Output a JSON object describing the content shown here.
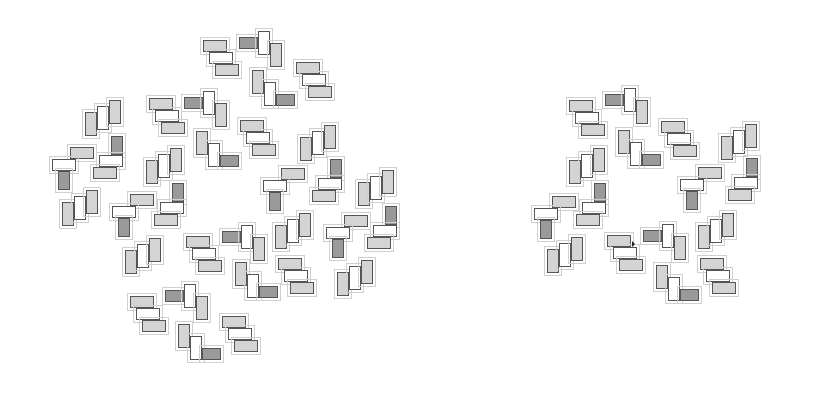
{
  "diagram": {
    "colors": {
      "light": "#d4d4d4",
      "white": "#ffffff",
      "dark": "#9a9a9a",
      "stroke": "#555555",
      "guide": "#d0d0d0"
    },
    "motif_types": {
      "H3": [
        [
          "light",
          0,
          0,
          24,
          12
        ],
        [
          "white",
          6,
          12,
          24,
          12
        ],
        [
          "light",
          12,
          24,
          24,
          12
        ]
      ],
      "V3": [
        [
          "light",
          0,
          12,
          12,
          24
        ],
        [
          "white",
          12,
          6,
          12,
          24
        ],
        [
          "light",
          24,
          0,
          12,
          24
        ]
      ],
      "Z": [
        [
          "dark",
          0,
          6,
          19,
          12
        ],
        [
          "white",
          19,
          0,
          12,
          24
        ],
        [
          "light",
          31,
          12,
          12,
          24
        ]
      ],
      "Zv": [
        [
          "light",
          0,
          0,
          12,
          24
        ],
        [
          "white",
          12,
          12,
          12,
          24
        ],
        [
          "dark",
          24,
          24,
          19,
          12
        ]
      ],
      "Tb": [
        [
          "light",
          18,
          0,
          24,
          12
        ],
        [
          "white",
          0,
          12,
          24,
          12
        ],
        [
          "dark",
          6,
          24,
          12,
          19
        ]
      ],
      "Tt": [
        [
          "dark",
          18,
          0,
          12,
          19
        ],
        [
          "white",
          6,
          19,
          24,
          12
        ],
        [
          "light",
          0,
          31,
          24,
          12
        ]
      ]
    },
    "left_panel": {
      "motifs": [
        {
          "type": "H3",
          "x": 203,
          "y": 40
        },
        {
          "type": "Z",
          "x": 239,
          "y": 31
        },
        {
          "type": "H3",
          "x": 296,
          "y": 62
        },
        {
          "type": "V3",
          "x": 85,
          "y": 100
        },
        {
          "type": "H3",
          "x": 149,
          "y": 98
        },
        {
          "type": "Z",
          "x": 184,
          "y": 91
        },
        {
          "type": "Zv",
          "x": 252,
          "y": 70
        },
        {
          "type": "H3",
          "x": 240,
          "y": 120
        },
        {
          "type": "Zv",
          "x": 196,
          "y": 131
        },
        {
          "type": "V3",
          "x": 300,
          "y": 125
        },
        {
          "type": "Tb",
          "x": 52,
          "y": 147
        },
        {
          "type": "Tt",
          "x": 93,
          "y": 136
        },
        {
          "type": "V3",
          "x": 146,
          "y": 148
        },
        {
          "type": "Tt",
          "x": 154,
          "y": 183
        },
        {
          "type": "V3",
          "x": 62,
          "y": 190
        },
        {
          "type": "Tb",
          "x": 112,
          "y": 194
        },
        {
          "type": "Tb",
          "x": 263,
          "y": 168
        },
        {
          "type": "Tt",
          "x": 312,
          "y": 159
        },
        {
          "type": "V3",
          "x": 358,
          "y": 170
        },
        {
          "type": "V3",
          "x": 275,
          "y": 213
        },
        {
          "type": "Tt",
          "x": 367,
          "y": 206
        },
        {
          "type": "Tb",
          "x": 326,
          "y": 215
        },
        {
          "type": "V3",
          "x": 125,
          "y": 238
        },
        {
          "type": "H3",
          "x": 186,
          "y": 236
        },
        {
          "type": "Z",
          "x": 222,
          "y": 225
        },
        {
          "type": "Zv",
          "x": 235,
          "y": 262
        },
        {
          "type": "H3",
          "x": 278,
          "y": 258
        },
        {
          "type": "V3",
          "x": 337,
          "y": 260
        },
        {
          "type": "H3",
          "x": 130,
          "y": 296
        },
        {
          "type": "Z",
          "x": 165,
          "y": 284
        },
        {
          "type": "Zv",
          "x": 178,
          "y": 324
        },
        {
          "type": "H3",
          "x": 222,
          "y": 316
        }
      ]
    },
    "right_panel": {
      "motifs": [
        {
          "type": "H3",
          "x": 569,
          "y": 100
        },
        {
          "type": "Z",
          "x": 605,
          "y": 88
        },
        {
          "type": "H3",
          "x": 661,
          "y": 121
        },
        {
          "type": "Zv",
          "x": 618,
          "y": 130
        },
        {
          "type": "V3",
          "x": 569,
          "y": 148
        },
        {
          "type": "V3",
          "x": 721,
          "y": 124
        },
        {
          "type": "Tb",
          "x": 534,
          "y": 196
        },
        {
          "type": "Tt",
          "x": 576,
          "y": 183
        },
        {
          "type": "Tb",
          "x": 680,
          "y": 167
        },
        {
          "type": "Tt",
          "x": 728,
          "y": 158
        },
        {
          "type": "V3",
          "x": 547,
          "y": 237
        },
        {
          "type": "H3",
          "x": 607,
          "y": 235
        },
        {
          "type": "Z",
          "x": 643,
          "y": 224
        },
        {
          "type": "V3",
          "x": 698,
          "y": 213
        },
        {
          "type": "Zv",
          "x": 656,
          "y": 265
        },
        {
          "type": "H3",
          "x": 700,
          "y": 258
        }
      ],
      "cursor": {
        "x": 632,
        "y": 241
      }
    }
  }
}
